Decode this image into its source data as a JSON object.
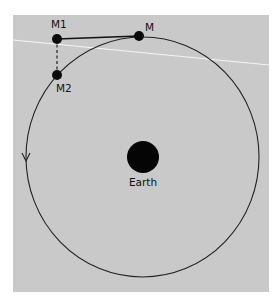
{
  "diagram": {
    "background_color": "#c9c9c9",
    "page_color": "#ffffff",
    "ink_color": "#111111",
    "horizon_line_color": "#f2f2f2",
    "labels": {
      "m": "M",
      "m1": "M1",
      "m2": "M2",
      "earth": "Earth"
    },
    "orbit": {
      "cx": 142.5,
      "cy": 157,
      "rx": 116.5,
      "ry": 120,
      "direction": "counterclockwise"
    },
    "earth": {
      "cx": 143,
      "cy": 157,
      "r": 16
    },
    "points": [
      {
        "id": "M",
        "x": 139,
        "y": 36
      },
      {
        "id": "M1",
        "x": 57,
        "y": 39
      },
      {
        "id": "M2",
        "x": 57,
        "y": 75
      }
    ],
    "segments": [
      {
        "from": "M1",
        "to": "M",
        "style": "solid"
      },
      {
        "from": "M1",
        "to": "M2",
        "style": "dashed"
      }
    ],
    "tangent_line": {
      "x1": 13,
      "y1": 40,
      "x2": 269,
      "y2": 65
    }
  }
}
